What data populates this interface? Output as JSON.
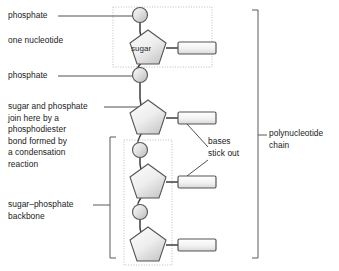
{
  "figure": {
    "type": "biology-diagram",
    "background_color": "#ffffff",
    "line_color": "#3c3c3c",
    "text_color": "#1a1a1a",
    "dotted_box_color": "#b4b4b4",
    "bracket_color": "#5a5a5a",
    "shape_fill_light": "#f2f2f2",
    "shape_fill_dark": "#c8c8c8",
    "shape_stroke": "#555555"
  },
  "labels": {
    "phosphate_top": "phosphate",
    "one_nucleotide": "one nucleotide",
    "phosphate_second": "phosphate",
    "phosphodiester": "sugar and phosphate\njoin here by a\nphosphodiester\nbond formed by\na condensation\nreaction",
    "sugar_phosphate_backbone": "sugar–phosphate\nbackbone",
    "bases_stick_out": "bases\nstick out",
    "polynucleotide_chain": "polynucleotide\nchain",
    "sugar_in_pentagon": "sugar"
  },
  "structure": {
    "phosphate_circles": [
      {
        "id": "phosphate-1",
        "cx": 140,
        "cy": 15,
        "r": 7.5
      },
      {
        "id": "phosphate-2",
        "cx": 140,
        "cy": 75,
        "r": 7.5
      },
      {
        "id": "phosphate-3",
        "cx": 140,
        "cy": 150,
        "r": 7.5
      },
      {
        "id": "phosphate-4",
        "cx": 140,
        "cy": 212,
        "r": 7.5
      }
    ],
    "sugar_pentagons": [
      {
        "id": "sugar-1",
        "cx": 148,
        "cy": 48,
        "r": 20,
        "labeled": true
      },
      {
        "id": "sugar-2",
        "cx": 148,
        "cy": 118,
        "r": 20,
        "labeled": false
      },
      {
        "id": "sugar-3",
        "cx": 148,
        "cy": 182,
        "r": 20,
        "labeled": false
      },
      {
        "id": "sugar-4",
        "cx": 148,
        "cy": 245,
        "r": 20,
        "labeled": false
      }
    ],
    "base_rectangles": [
      {
        "id": "base-1",
        "x": 178,
        "y": 42,
        "w": 38,
        "h": 12
      },
      {
        "id": "base-2",
        "x": 178,
        "y": 112,
        "w": 38,
        "h": 12
      },
      {
        "id": "base-3",
        "x": 178,
        "y": 176,
        "w": 38,
        "h": 12
      },
      {
        "id": "base-4",
        "x": 178,
        "y": 239,
        "w": 38,
        "h": 12
      }
    ],
    "dotted_boxes": [
      {
        "id": "one-nucleotide-box",
        "x": 113,
        "y": 7,
        "w": 99,
        "h": 60
      },
      {
        "id": "backbone-box",
        "x": 124,
        "y": 140,
        "w": 48,
        "h": 125
      }
    ],
    "brackets": [
      {
        "id": "backbone-bracket",
        "side": "left",
        "x": 110,
        "y1": 137,
        "y2": 258,
        "tick_y": 205
      },
      {
        "id": "polynucleotide-bracket",
        "side": "right",
        "x": 258,
        "y1": 10,
        "y2": 258,
        "tick_y": 135
      }
    ]
  }
}
